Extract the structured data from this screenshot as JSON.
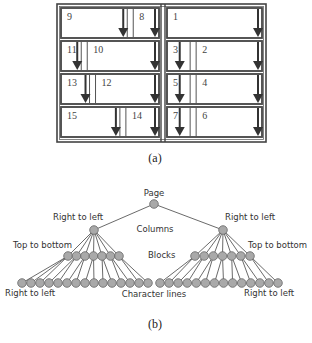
{
  "figure_a": {
    "caption": "(a)",
    "frame": {
      "x": 57,
      "y": 4,
      "w": 209,
      "h": 138
    },
    "divider_x": 163,
    "rows_y": [
      8,
      41,
      74,
      107
    ],
    "row_h": 30,
    "left_column": {
      "x0": 61,
      "x1": 159,
      "rows": [
        {
          "cells": [
            {
              "label": "9",
              "w": 0.72,
              "arrow": "right"
            },
            {
              "label": "8",
              "w": 0.28,
              "arrow": "right"
            }
          ]
        },
        {
          "cells": [
            {
              "label": "11",
              "w": 0.22,
              "arrow": "right"
            },
            {
              "label": "10",
              "w": 0.78,
              "arrow": "right"
            }
          ]
        },
        {
          "cells": [
            {
              "label": "13",
              "w": 0.31,
              "arrow": "right"
            },
            {
              "label": "12",
              "w": 0.69,
              "arrow": "right"
            }
          ]
        },
        {
          "cells": [
            {
              "label": "15",
              "w": 0.64,
              "arrow": "right"
            },
            {
              "label": "14",
              "w": 0.36,
              "arrow": "right"
            }
          ]
        }
      ]
    },
    "right_column": {
      "x0": 167,
      "x1": 262,
      "rows": [
        {
          "cells": [
            {
              "label": "1",
              "w": 1.0,
              "arrow": "right"
            }
          ]
        },
        {
          "cells": [
            {
              "label": "3",
              "w": 0.26,
              "arrow": "center"
            },
            {
              "label": "2",
              "w": 0.74,
              "arrow": "right"
            }
          ]
        },
        {
          "cells": [
            {
              "label": "5",
              "w": 0.26,
              "arrow": "center"
            },
            {
              "label": "4",
              "w": 0.74,
              "arrow": "right"
            }
          ]
        },
        {
          "cells": [
            {
              "label": "7",
              "w": 0.26,
              "arrow": "center"
            },
            {
              "label": "6",
              "w": 0.74,
              "arrow": "right"
            }
          ]
        }
      ]
    }
  },
  "figure_b": {
    "caption": "(b)",
    "root": {
      "label": "Page",
      "x": 154,
      "y": 204
    },
    "levels": {
      "columns": {
        "label": "Columns",
        "x": 155,
        "y": 232
      },
      "blocks": {
        "label": "Blocks",
        "x": 148,
        "y": 258
      },
      "lines": {
        "label": "Character lines",
        "x": 154,
        "y": 297
      }
    },
    "subtrees": [
      {
        "node": {
          "x": 94,
          "y": 230,
          "label": "Right to left",
          "label_x": 53,
          "label_y": 220
        },
        "blocks": {
          "x_start": 68,
          "x_end": 119,
          "count": 7,
          "y": 256,
          "label": "Top to bottom",
          "label_x": 13,
          "label_y": 248
        },
        "lines": {
          "x_start": 22,
          "x_end": 148,
          "count": 15,
          "y": 283,
          "label": "Right to left",
          "label_x": 5,
          "label_y": 296
        }
      },
      {
        "node": {
          "x": 223,
          "y": 230,
          "label": "Right to left",
          "label_x": 225,
          "label_y": 220
        },
        "blocks": {
          "x_start": 195,
          "x_end": 250,
          "count": 7,
          "y": 256,
          "label": "Top to bottom",
          "label_x": 248,
          "label_y": 248
        },
        "lines": {
          "x_start": 160,
          "x_end": 278,
          "count": 14,
          "y": 283,
          "label": "Right to left",
          "label_x": 244,
          "label_y": 296
        }
      }
    ],
    "node_fill": "#a9a9a9",
    "node_stroke": "#666666"
  }
}
